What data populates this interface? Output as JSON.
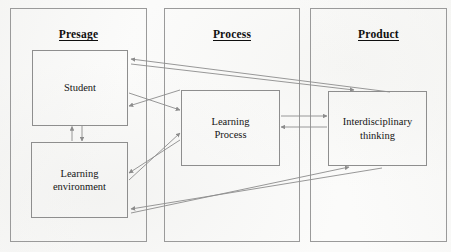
{
  "diagram": {
    "title_style": "bold-underlined-serif",
    "panels": [
      {
        "id": "presage",
        "label": "Presage"
      },
      {
        "id": "process",
        "label": "Process"
      },
      {
        "id": "product",
        "label": "Product"
      }
    ],
    "nodes": [
      {
        "id": "student",
        "label": "Student",
        "panel": "presage"
      },
      {
        "id": "learning-environment",
        "label": "Learning environment",
        "line1": "Learning",
        "line2": "environment",
        "panel": "presage"
      },
      {
        "id": "learning-process",
        "label": "Learning Process",
        "line1": "Learning",
        "line2": "Process",
        "panel": "process"
      },
      {
        "id": "interdisciplinary-thinking",
        "label": "Interdisciplinary thinking",
        "line1": "Interdisciplinary",
        "line2": "thinking",
        "panel": "product"
      }
    ],
    "edges": [
      {
        "from": "learning-environment",
        "to": "student",
        "direction": "up",
        "style": "vertical"
      },
      {
        "from": "student",
        "to": "learning-environment",
        "direction": "down",
        "style": "vertical"
      },
      {
        "from": "student",
        "to": "learning-process",
        "direction": "right",
        "style": "diagonal"
      },
      {
        "from": "learning-process",
        "to": "student",
        "direction": "left",
        "style": "diagonal"
      },
      {
        "from": "learning-environment",
        "to": "learning-process",
        "direction": "right",
        "style": "diagonal"
      },
      {
        "from": "learning-process",
        "to": "learning-environment",
        "direction": "left",
        "style": "diagonal"
      },
      {
        "from": "learning-process",
        "to": "interdisciplinary-thinking",
        "direction": "right",
        "style": "horizontal"
      },
      {
        "from": "interdisciplinary-thinking",
        "to": "learning-process",
        "direction": "left",
        "style": "horizontal"
      },
      {
        "from": "interdisciplinary-thinking",
        "to": "student",
        "direction": "left",
        "style": "long-diagonal"
      },
      {
        "from": "student",
        "to": "interdisciplinary-thinking",
        "direction": "right",
        "style": "long-diagonal"
      },
      {
        "from": "interdisciplinary-thinking",
        "to": "learning-environment",
        "direction": "left",
        "style": "long-diagonal"
      },
      {
        "from": "learning-environment",
        "to": "interdisciplinary-thinking",
        "direction": "right",
        "style": "long-diagonal"
      }
    ],
    "colors": {
      "background": "#fbfbfa",
      "panel_border": "#9a9a9a",
      "node_border": "#8e8e8e",
      "edge": "#8c8c8c",
      "text": "#141414"
    }
  }
}
